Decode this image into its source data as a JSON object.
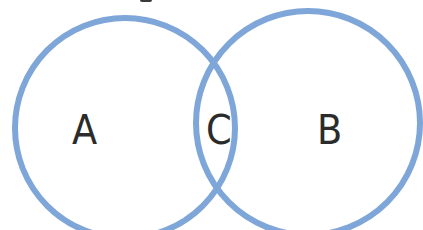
{
  "diagram": {
    "type": "venn",
    "colors": {
      "circle_stroke": "#7fa6d8",
      "label_text": "#2b2b2b",
      "background": "#ffffff"
    },
    "circles": [
      {
        "id": "A",
        "label": "A",
        "cx": 125,
        "cy": 128,
        "r": 110
      },
      {
        "id": "B",
        "label": "B",
        "cx": 308,
        "cy": 123,
        "r": 112
      }
    ],
    "intersection": {
      "id": "C",
      "label": "C"
    }
  }
}
